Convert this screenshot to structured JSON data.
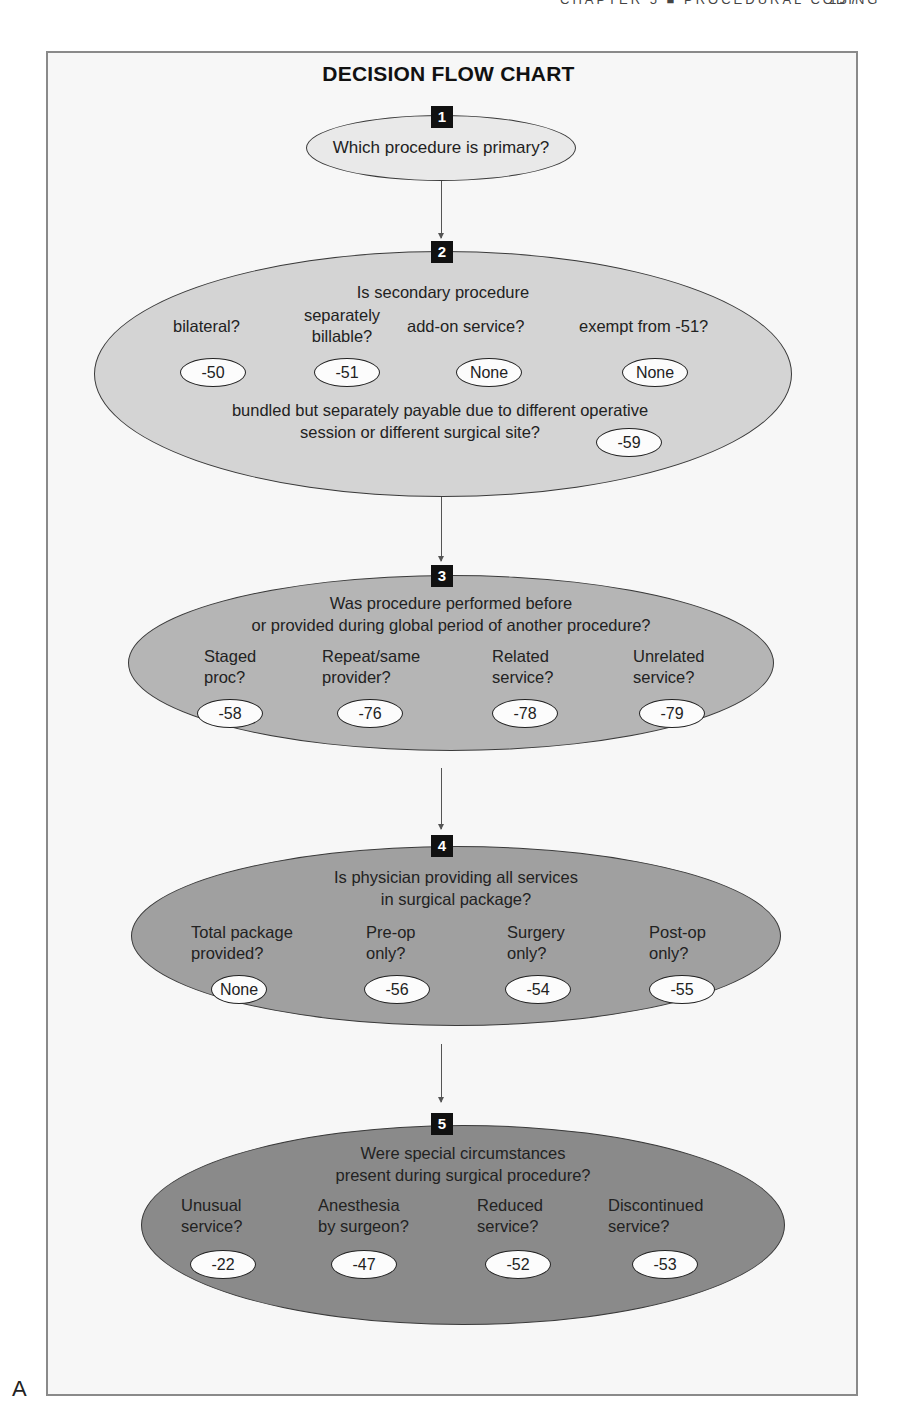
{
  "running_head": {
    "text": "CHAPTER 5  ■  PROCEDURAL CODING",
    "page_number": "157"
  },
  "figure_label": "A",
  "title": "DECISION FLOW CHART",
  "colors": {
    "step1_fill": "#e9e9e9",
    "step2_fill": "#d4d4d4",
    "step3_fill": "#b5b5b5",
    "step4_fill": "#a0a0a0",
    "step5_fill": "#8a8a8a",
    "badge": "#111111",
    "pill_fill": "#fcfcfc"
  },
  "steps": [
    {
      "number": "1",
      "question": "Which procedure is primary?"
    },
    {
      "number": "2",
      "question": "Is secondary procedure",
      "options": [
        {
          "label": "bilateral?",
          "modifier": "-50"
        },
        {
          "label": "separately billable?",
          "label_line1": "separately",
          "label_line2": "billable?",
          "modifier": "-51"
        },
        {
          "label": "add-on service?",
          "modifier": "None"
        },
        {
          "label": "exempt from -51?",
          "modifier": "None"
        }
      ],
      "extra": {
        "line1": "bundled but separately payable due to different operative",
        "line2": "session or different surgical site?",
        "modifier": "-59"
      }
    },
    {
      "number": "3",
      "question_line1": "Was procedure performed before",
      "question_line2": "or provided during global period of another procedure?",
      "options": [
        {
          "line1": "Staged",
          "line2": "proc?",
          "modifier": "-58"
        },
        {
          "line1": "Repeat/same",
          "line2": "provider?",
          "modifier": "-76"
        },
        {
          "line1": "Related",
          "line2": "service?",
          "modifier": "-78"
        },
        {
          "line1": "Unrelated",
          "line2": "service?",
          "modifier": "-79"
        }
      ]
    },
    {
      "number": "4",
      "question_line1": "Is physician providing all services",
      "question_line2": "in surgical package?",
      "options": [
        {
          "line1": "Total package",
          "line2": "provided?",
          "modifier": "None"
        },
        {
          "line1": "Pre-op",
          "line2": "only?",
          "modifier": "-56"
        },
        {
          "line1": "Surgery",
          "line2": "only?",
          "modifier": "-54"
        },
        {
          "line1": "Post-op",
          "line2": "only?",
          "modifier": "-55"
        }
      ]
    },
    {
      "number": "5",
      "question_line1": "Were special circumstances",
      "question_line2": "present during surgical procedure?",
      "options": [
        {
          "line1": "Unusual",
          "line2": "service?",
          "modifier": "-22"
        },
        {
          "line1": "Anesthesia",
          "line2": "by surgeon?",
          "modifier": "-47"
        },
        {
          "line1": "Reduced",
          "line2": "service?",
          "modifier": "-52"
        },
        {
          "line1": "Discontinued",
          "line2": "service?",
          "modifier": "-53"
        }
      ]
    }
  ]
}
